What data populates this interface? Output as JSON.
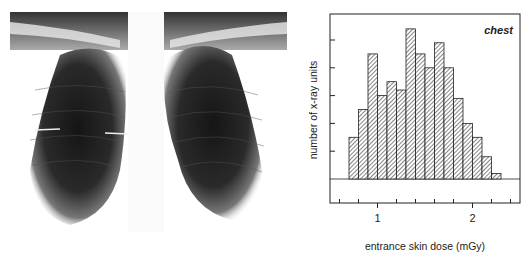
{
  "figure": {
    "left_panel": {
      "type": "image",
      "description": "chest x-ray radiograph (PA view)"
    },
    "right_panel": {
      "annotation": "chest"
    }
  },
  "chart_data": {
    "type": "bar",
    "title": "",
    "annotation": "chest",
    "xlabel": "entrance skin dose (mGy)",
    "ylabel": "number of x-ray units",
    "bin_width": 0.1,
    "bin_starts": [
      0.7,
      0.8,
      0.9,
      1.0,
      1.1,
      1.2,
      1.3,
      1.4,
      1.5,
      1.6,
      1.7,
      1.8,
      1.9,
      2.0,
      2.1,
      2.2
    ],
    "values": [
      1.5,
      2.5,
      4.5,
      3.0,
      3.5,
      3.2,
      5.4,
      4.5,
      4.0,
      4.9,
      4.0,
      2.9,
      2.0,
      1.5,
      0.8,
      0.2
    ],
    "xlim": [
      0.5,
      2.5
    ],
    "ylim": [
      -1.3,
      6.0
    ],
    "x_ticks_major": [
      1,
      2
    ],
    "x_tick_labels": [
      "1",
      "2"
    ],
    "x_ticks_minor": [
      0.6,
      0.8,
      1.2,
      1.4,
      1.6,
      1.8,
      2.2,
      2.4
    ],
    "y_ticks": [
      1,
      2,
      3,
      4,
      5
    ],
    "y_tick_labels_shown": false,
    "grid": false,
    "bar_fill": "diagonal hatch",
    "colors": {
      "bar_edge": "#222222",
      "hatch": "#333333",
      "axis": "#222222"
    }
  }
}
